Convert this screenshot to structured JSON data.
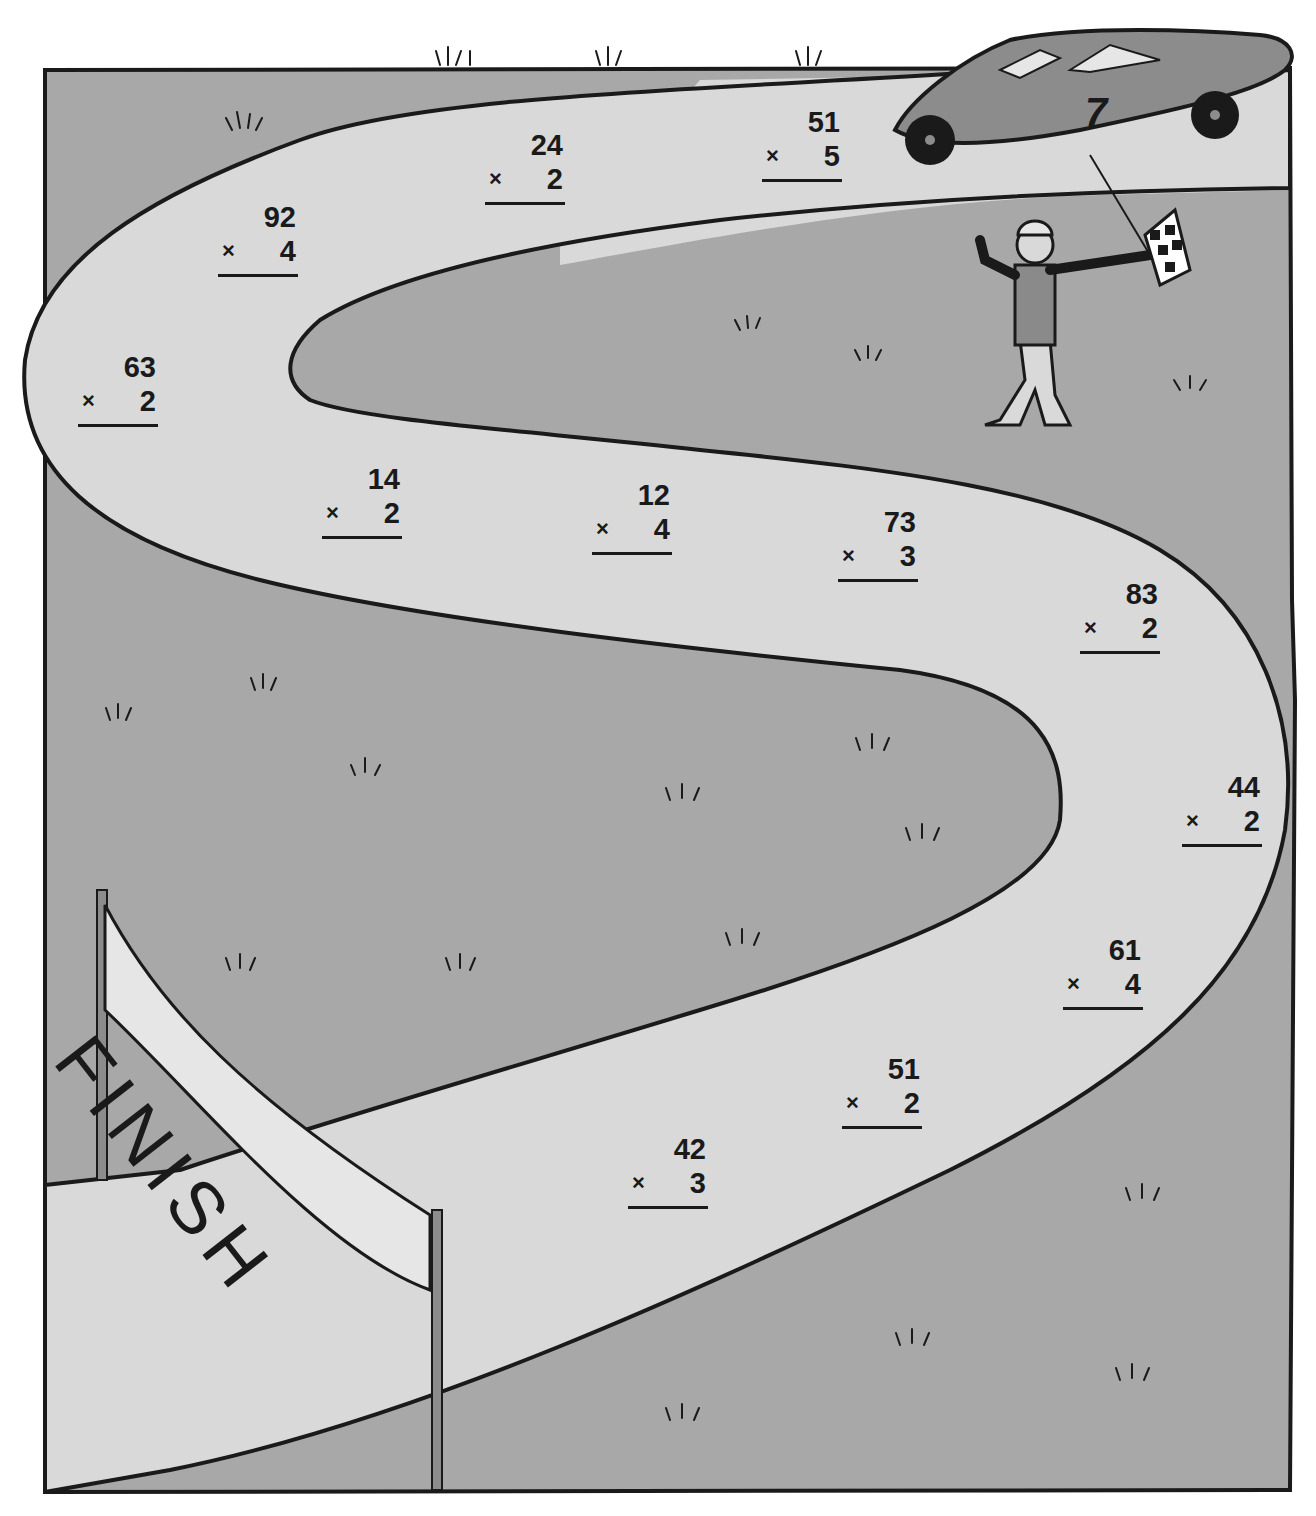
{
  "worksheet": {
    "type": "maze-race-track",
    "theme": "car race to finish line",
    "banner_label": "FINISH",
    "car_number": "7",
    "operator_symbol": "×"
  },
  "problems": [
    {
      "id": 1,
      "top": "51",
      "multiplier": "5"
    },
    {
      "id": 2,
      "top": "24",
      "multiplier": "2"
    },
    {
      "id": 3,
      "top": "92",
      "multiplier": "4"
    },
    {
      "id": 4,
      "top": "63",
      "multiplier": "2"
    },
    {
      "id": 5,
      "top": "14",
      "multiplier": "2"
    },
    {
      "id": 6,
      "top": "12",
      "multiplier": "4"
    },
    {
      "id": 7,
      "top": "73",
      "multiplier": "3"
    },
    {
      "id": 8,
      "top": "83",
      "multiplier": "2"
    },
    {
      "id": 9,
      "top": "44",
      "multiplier": "2"
    },
    {
      "id": 10,
      "top": "61",
      "multiplier": "4"
    },
    {
      "id": 11,
      "top": "51",
      "multiplier": "2"
    },
    {
      "id": 12,
      "top": "42",
      "multiplier": "3"
    }
  ],
  "colors": {
    "grass": "#a8a8a8",
    "road": "#d9d9d9",
    "ink": "#1a1a1a",
    "car": "#8c8c8c",
    "banner": "#e6e6e6"
  }
}
